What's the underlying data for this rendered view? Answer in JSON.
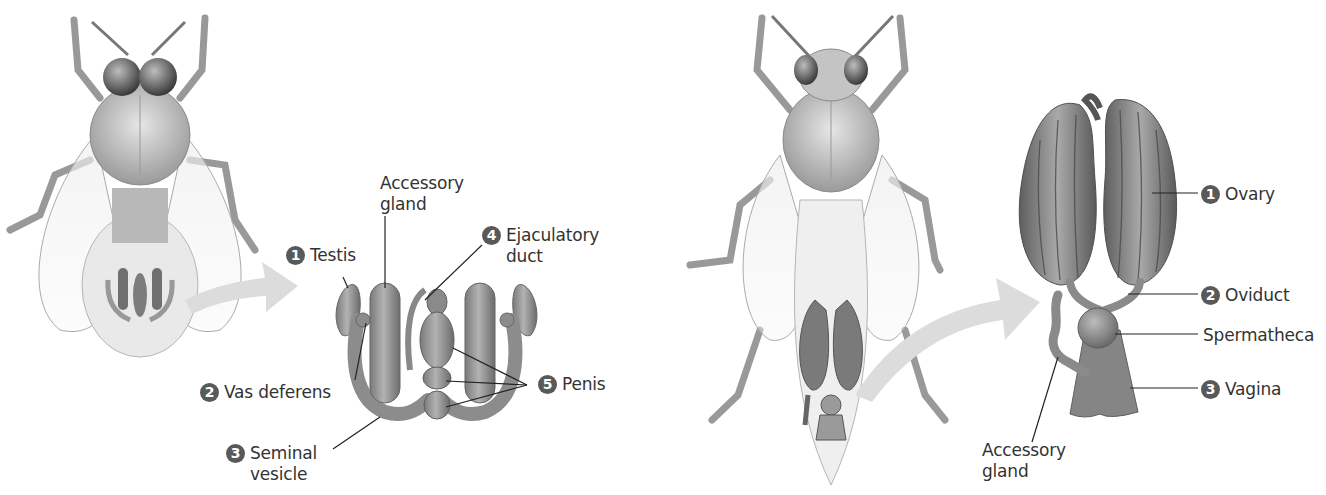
{
  "figure": {
    "colors": {
      "background": "#ffffff",
      "badge": "#595959",
      "label_text": "#333333",
      "arrow": "#dcdcdc",
      "organ_dark": "#6e6e6e",
      "organ_light": "#a8a8a8"
    }
  },
  "male": {
    "name": "Drone (male)",
    "labels": [
      {
        "id": "testis",
        "number": "1",
        "text": "Testis"
      },
      {
        "id": "accessory-gland",
        "number": "",
        "text_lines": [
          "Accessory",
          "gland"
        ]
      },
      {
        "id": "ejaculatory-duct",
        "number": "4",
        "text_lines": [
          "Ejaculatory",
          "duct"
        ]
      },
      {
        "id": "vas-deferens",
        "number": "2",
        "text": "Vas deferens"
      },
      {
        "id": "penis",
        "number": "5",
        "text": "Penis"
      },
      {
        "id": "seminal-vesicle",
        "number": "3",
        "text_lines": [
          "Seminal",
          "vesicle"
        ]
      }
    ]
  },
  "female": {
    "name": "Queen (female)",
    "labels": [
      {
        "id": "ovary",
        "number": "1",
        "text": "Ovary"
      },
      {
        "id": "oviduct",
        "number": "2",
        "text": "Oviduct"
      },
      {
        "id": "spermatheca",
        "number": "",
        "text": "Spermatheca"
      },
      {
        "id": "vagina",
        "number": "3",
        "text": "Vagina"
      },
      {
        "id": "accessory-gland",
        "number": "",
        "text_lines": [
          "Accessory",
          "gland"
        ]
      }
    ]
  }
}
